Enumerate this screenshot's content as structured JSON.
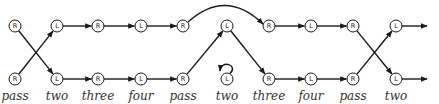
{
  "diagram": {
    "colors": {
      "stroke": "#1a1a1a",
      "label": "#333333",
      "background": "#ffffff"
    },
    "rows": {
      "top_y": 26,
      "bottom_y": 79,
      "label_y": 100
    },
    "nodes": [
      {
        "id": "t0",
        "label": "R",
        "x": 15,
        "row": "top"
      },
      {
        "id": "t1",
        "label": "L",
        "x": 57,
        "row": "top"
      },
      {
        "id": "t2",
        "label": "R",
        "x": 98,
        "row": "top"
      },
      {
        "id": "t3",
        "label": "L",
        "x": 141,
        "row": "top"
      },
      {
        "id": "t4",
        "label": "R",
        "x": 183,
        "row": "top"
      },
      {
        "id": "t5",
        "label": "L",
        "x": 227,
        "row": "top"
      },
      {
        "id": "t6",
        "label": "R",
        "x": 269,
        "row": "top"
      },
      {
        "id": "t7",
        "label": "L",
        "x": 311,
        "row": "top"
      },
      {
        "id": "t8",
        "label": "R",
        "x": 353,
        "row": "top"
      },
      {
        "id": "t9",
        "label": "L",
        "x": 396,
        "row": "top"
      },
      {
        "id": "b0",
        "label": "R",
        "x": 15,
        "row": "bottom"
      },
      {
        "id": "b1",
        "label": "L",
        "x": 57,
        "row": "bottom"
      },
      {
        "id": "b2",
        "label": "R",
        "x": 98,
        "row": "bottom"
      },
      {
        "id": "b3",
        "label": "L",
        "x": 141,
        "row": "bottom"
      },
      {
        "id": "b4",
        "label": "R",
        "x": 183,
        "row": "bottom"
      },
      {
        "id": "b5",
        "label": "L",
        "x": 227,
        "row": "bottom"
      },
      {
        "id": "b6",
        "label": "R",
        "x": 269,
        "row": "bottom"
      },
      {
        "id": "b7",
        "label": "L",
        "x": 311,
        "row": "bottom"
      },
      {
        "id": "b8",
        "label": "R",
        "x": 353,
        "row": "bottom"
      },
      {
        "id": "b9",
        "label": "L",
        "x": 396,
        "row": "bottom"
      }
    ],
    "edges": [
      {
        "from": "t0",
        "to": "b1",
        "type": "straight"
      },
      {
        "from": "b0",
        "to": "t1",
        "type": "straight"
      },
      {
        "from": "t1",
        "to": "t2",
        "type": "straight"
      },
      {
        "from": "t2",
        "to": "t3",
        "type": "straight"
      },
      {
        "from": "t3",
        "to": "t4",
        "type": "straight"
      },
      {
        "from": "b1",
        "to": "b2",
        "type": "straight"
      },
      {
        "from": "b2",
        "to": "b3",
        "type": "straight"
      },
      {
        "from": "b3",
        "to": "b4",
        "type": "straight"
      },
      {
        "from": "t4",
        "to": "t6",
        "type": "arc"
      },
      {
        "from": "b4",
        "to": "t5",
        "type": "straight"
      },
      {
        "from": "t5",
        "to": "b6",
        "type": "straight"
      },
      {
        "from": "b5",
        "to": "b5",
        "type": "self-loop"
      },
      {
        "from": "t6",
        "to": "t7",
        "type": "straight"
      },
      {
        "from": "t7",
        "to": "t8",
        "type": "straight"
      },
      {
        "from": "b6",
        "to": "b7",
        "type": "straight"
      },
      {
        "from": "b7",
        "to": "b8",
        "type": "straight"
      },
      {
        "from": "t8",
        "to": "b9",
        "type": "straight"
      },
      {
        "from": "b8",
        "to": "t9",
        "type": "straight"
      },
      {
        "from": "t9",
        "to": "out",
        "type": "exit",
        "x2": 427
      },
      {
        "from": "b9",
        "to": "out",
        "type": "exit",
        "x2": 427
      }
    ],
    "step_labels": [
      {
        "x": 15,
        "text": "pass"
      },
      {
        "x": 57,
        "text": "two"
      },
      {
        "x": 98,
        "text": "three"
      },
      {
        "x": 141,
        "text": "four"
      },
      {
        "x": 183,
        "text": "pass"
      },
      {
        "x": 227,
        "text": "two"
      },
      {
        "x": 269,
        "text": "three"
      },
      {
        "x": 311,
        "text": "four"
      },
      {
        "x": 353,
        "text": "pass"
      },
      {
        "x": 396,
        "text": "two"
      }
    ]
  }
}
